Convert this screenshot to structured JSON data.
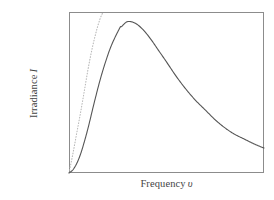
{
  "figure": {
    "title": "",
    "background_color": "#ffffff",
    "frame_color": "#8c8c8c",
    "width": 274,
    "height": 200
  },
  "axes": {
    "ylabel_text": "Irradiance",
    "ylabel_symbol": "I",
    "xlabel_text": "Frequency",
    "xlabel_symbol": "υ",
    "tick_labels_x": [],
    "tick_labels_y": [],
    "grid": false
  },
  "chart_data": {
    "type": "line",
    "title": "",
    "xlabel": "Frequency υ",
    "ylabel": "Irradiance I",
    "xlim": [
      0,
      1
    ],
    "ylim": [
      0,
      1
    ],
    "grid": false,
    "legend": null,
    "annotations": [],
    "series": [
      {
        "name": "Planck blackbody spectrum",
        "style": "solid",
        "color": "#555555",
        "width": 1.1,
        "x": [
          0.0,
          0.02,
          0.04,
          0.06,
          0.08,
          0.1,
          0.13,
          0.16,
          0.19,
          0.22,
          0.26,
          0.27,
          0.3,
          0.34,
          0.38,
          0.42,
          0.46,
          0.5,
          0.55,
          0.6,
          0.65,
          0.7,
          0.75,
          0.8,
          0.85,
          0.9,
          0.95,
          1.0
        ],
        "y": [
          0.0,
          0.02,
          0.06,
          0.12,
          0.2,
          0.29,
          0.44,
          0.58,
          0.7,
          0.8,
          0.9,
          0.91,
          0.94,
          0.93,
          0.89,
          0.83,
          0.76,
          0.69,
          0.6,
          0.52,
          0.45,
          0.39,
          0.33,
          0.28,
          0.24,
          0.21,
          0.18,
          0.155
        ]
      },
      {
        "name": "Rayleigh-Jeans law",
        "style": "dotted",
        "color": "#b8b8b8",
        "width": 1.1,
        "x": [
          0.0,
          0.02,
          0.04,
          0.06,
          0.08,
          0.1,
          0.12,
          0.14,
          0.16,
          0.175
        ],
        "y": [
          0.0,
          0.12,
          0.25,
          0.38,
          0.52,
          0.66,
          0.78,
          0.88,
          0.96,
          1.0
        ]
      }
    ]
  }
}
